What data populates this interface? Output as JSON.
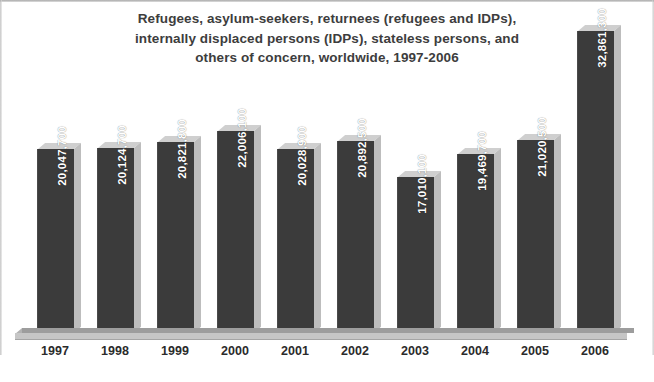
{
  "chart_data": {
    "type": "bar",
    "title": "Refugees, asylum-seekers, returnees (refugees and IDPs), internally displaced persons (IDPs), stateless persons, and others of concern, worldwide, 1997-2006",
    "title_lines": [
      "Refugees, asylum-seekers, returnees (refugees and IDPs),",
      "internally displaced persons (IDPs), stateless persons, and",
      "others of concern, worldwide, 1997-2006"
    ],
    "xlabel": "",
    "ylabel": "",
    "categories": [
      "1997",
      "1998",
      "1999",
      "2000",
      "2001",
      "2002",
      "2003",
      "2004",
      "2005",
      "2006"
    ],
    "values": [
      20047700,
      20124700,
      20821800,
      22006100,
      20028900,
      20892500,
      17010100,
      19469700,
      21020500,
      32861300
    ],
    "value_labels": [
      "20,047,700",
      "20,124,700",
      "20,821,800",
      "22,006,100",
      "20,028,900",
      "20,892,500",
      "17,010,100",
      "19,469,700",
      "21,020,500",
      "32,861,300"
    ],
    "ylim": [
      0,
      32861300
    ],
    "grid": false,
    "legend": null,
    "bar_color": "#3b3b3b",
    "bar_top_color": "#cfcfcf",
    "bar_side_color": "#bdbdbd",
    "title_color": "#3d3d3d",
    "value_label_color": "#ffffff",
    "axis_label_color": "#2b2b2b",
    "background_color": "#ffffff"
  },
  "bars": [
    {
      "year": "1997",
      "label": "20,047,700",
      "left": 37,
      "height": 184
    },
    {
      "year": "1998",
      "label": "20,124,700",
      "left": 97,
      "height": 185
    },
    {
      "year": "1999",
      "label": "20,821,800",
      "left": 157,
      "height": 191
    },
    {
      "year": "2000",
      "label": "22,006,100",
      "left": 217,
      "height": 202
    },
    {
      "year": "2001",
      "label": "20,028,900",
      "left": 277,
      "height": 184
    },
    {
      "year": "2002",
      "label": "20,892,500",
      "left": 337,
      "height": 192
    },
    {
      "year": "2003",
      "label": "17,010,100",
      "left": 397,
      "height": 156
    },
    {
      "year": "2004",
      "label": "19,469,700",
      "left": 457,
      "height": 179
    },
    {
      "year": "2005",
      "label": "21,020,500",
      "left": 517,
      "height": 193
    },
    {
      "year": "2006",
      "label": "32,861,300",
      "left": 577,
      "height": 302
    }
  ]
}
